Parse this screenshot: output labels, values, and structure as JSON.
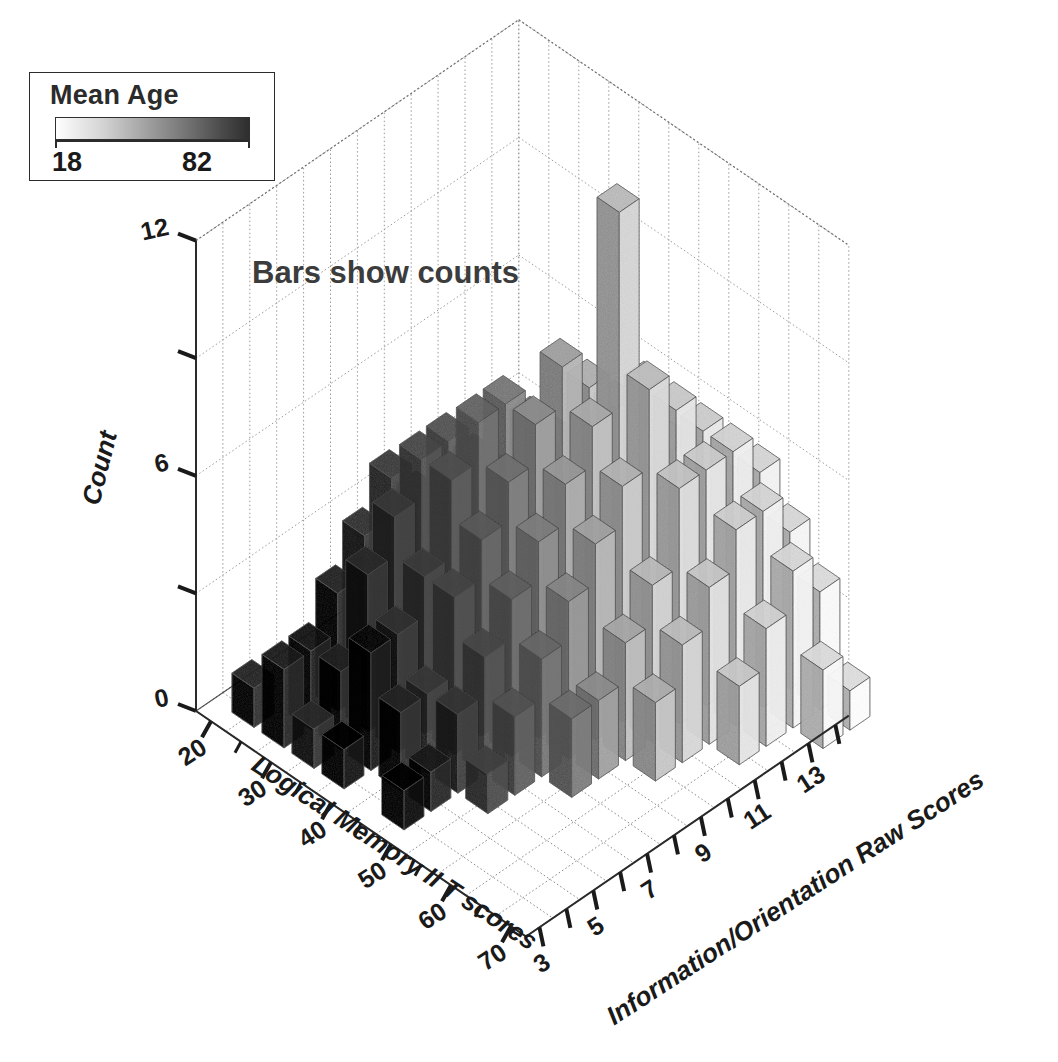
{
  "figure": {
    "annotation": "Bars show counts",
    "background": "#ffffff"
  },
  "legend": {
    "title": "Mean Age",
    "min_label": "18",
    "max_label": "82",
    "min_color": "#ffffff",
    "max_color": "#2e2e2e",
    "ramp_name": "grayscale-ramp"
  },
  "chart_data": {
    "type": "bar",
    "subtype": "3d-bar-histogram",
    "title": "",
    "annotation": "Bars show counts",
    "xlabel": "Logical Memory II T scores",
    "ylabel": "Information/Orientation Raw Scores",
    "zlabel": "Count",
    "xlim": [
      17.5,
      72.5
    ],
    "ylim": [
      2.5,
      14.5
    ],
    "zlim": [
      0,
      12
    ],
    "x_ticks": [
      20,
      30,
      40,
      50,
      60,
      70
    ],
    "x_ticklabels": [
      "20",
      "30",
      "40",
      "50",
      "60",
      "70"
    ],
    "x_minor_ticks": [
      25,
      35,
      45,
      55,
      65
    ],
    "y_ticks": [
      3,
      4,
      5,
      6,
      7,
      8,
      9,
      10,
      11,
      12,
      13,
      14
    ],
    "y_ticklabels": [
      "3",
      "",
      "5",
      "",
      "7",
      "",
      "9",
      "",
      "11",
      "",
      "13",
      ""
    ],
    "z_ticks": [
      0,
      3,
      6,
      9,
      12
    ],
    "z_ticklabels": [
      "0",
      "",
      "6",
      "",
      "12"
    ],
    "grid": true,
    "legend_position": "top-left",
    "color_scale": {
      "name": "Mean Age",
      "domain": [
        18,
        82
      ],
      "range": [
        "#ffffff",
        "#2e2e2e"
      ],
      "type": "grayscale-sequential"
    },
    "bar_cell_size": {
      "x": 5,
      "y": 1
    },
    "value_key": "count",
    "color_key": "mean_age",
    "bars": [
      {
        "x": 20,
        "y": 3,
        "count": 1,
        "mean_age": 74
      },
      {
        "x": 25,
        "y": 3,
        "count": 2,
        "mean_age": 76
      },
      {
        "x": 30,
        "y": 3,
        "count": 1,
        "mean_age": 73
      },
      {
        "x": 35,
        "y": 3,
        "count": 1,
        "mean_age": 79
      },
      {
        "x": 45,
        "y": 3,
        "count": 1,
        "mean_age": 80
      },
      {
        "x": 25,
        "y": 4,
        "count": 2,
        "mean_age": 77
      },
      {
        "x": 30,
        "y": 4,
        "count": 2,
        "mean_age": 75
      },
      {
        "x": 35,
        "y": 4,
        "count": 3,
        "mean_age": 78
      },
      {
        "x": 40,
        "y": 4,
        "count": 2,
        "mean_age": 74
      },
      {
        "x": 45,
        "y": 4,
        "count": 1,
        "mean_age": 76
      },
      {
        "x": 25,
        "y": 5,
        "count": 3,
        "mean_age": 75
      },
      {
        "x": 30,
        "y": 5,
        "count": 4,
        "mean_age": 73
      },
      {
        "x": 35,
        "y": 5,
        "count": 3,
        "mean_age": 72
      },
      {
        "x": 40,
        "y": 5,
        "count": 2,
        "mean_age": 70
      },
      {
        "x": 45,
        "y": 5,
        "count": 2,
        "mean_age": 71
      },
      {
        "x": 50,
        "y": 5,
        "count": 1,
        "mean_age": 68
      },
      {
        "x": 25,
        "y": 6,
        "count": 4,
        "mean_age": 72
      },
      {
        "x": 30,
        "y": 6,
        "count": 5,
        "mean_age": 70
      },
      {
        "x": 35,
        "y": 6,
        "count": 4,
        "mean_age": 69
      },
      {
        "x": 40,
        "y": 6,
        "count": 4,
        "mean_age": 67
      },
      {
        "x": 45,
        "y": 6,
        "count": 3,
        "mean_age": 66
      },
      {
        "x": 50,
        "y": 6,
        "count": 2,
        "mean_age": 63
      },
      {
        "x": 25,
        "y": 7,
        "count": 5,
        "mean_age": 69
      },
      {
        "x": 30,
        "y": 7,
        "count": 6,
        "mean_age": 66
      },
      {
        "x": 35,
        "y": 7,
        "count": 6,
        "mean_age": 64
      },
      {
        "x": 40,
        "y": 7,
        "count": 5,
        "mean_age": 61
      },
      {
        "x": 45,
        "y": 7,
        "count": 4,
        "mean_age": 59
      },
      {
        "x": 50,
        "y": 7,
        "count": 3,
        "mean_age": 57
      },
      {
        "x": 55,
        "y": 7,
        "count": 2,
        "mean_age": 55
      },
      {
        "x": 25,
        "y": 8,
        "count": 4,
        "mean_age": 67
      },
      {
        "x": 30,
        "y": 8,
        "count": 6,
        "mean_age": 63
      },
      {
        "x": 35,
        "y": 8,
        "count": 7,
        "mean_age": 58
      },
      {
        "x": 40,
        "y": 8,
        "count": 6,
        "mean_age": 54
      },
      {
        "x": 45,
        "y": 8,
        "count": 5,
        "mean_age": 50
      },
      {
        "x": 50,
        "y": 8,
        "count": 4,
        "mean_age": 47
      },
      {
        "x": 55,
        "y": 8,
        "count": 2,
        "mean_age": 45
      },
      {
        "x": 30,
        "y": 9,
        "count": 5,
        "mean_age": 58
      },
      {
        "x": 35,
        "y": 9,
        "count": 7,
        "mean_age": 52
      },
      {
        "x": 40,
        "y": 9,
        "count": 7,
        "mean_age": 45
      },
      {
        "x": 45,
        "y": 9,
        "count": 6,
        "mean_age": 41
      },
      {
        "x": 50,
        "y": 9,
        "count": 5,
        "mean_age": 38
      },
      {
        "x": 55,
        "y": 9,
        "count": 3,
        "mean_age": 36
      },
      {
        "x": 60,
        "y": 9,
        "count": 2,
        "mean_age": 34
      },
      {
        "x": 30,
        "y": 10,
        "count": 4,
        "mean_age": 54
      },
      {
        "x": 35,
        "y": 10,
        "count": 6,
        "mean_age": 46
      },
      {
        "x": 40,
        "y": 10,
        "count": 8,
        "mean_age": 39
      },
      {
        "x": 45,
        "y": 10,
        "count": 7,
        "mean_age": 35
      },
      {
        "x": 50,
        "y": 10,
        "count": 6,
        "mean_age": 32
      },
      {
        "x": 55,
        "y": 10,
        "count": 4,
        "mean_age": 30
      },
      {
        "x": 60,
        "y": 10,
        "count": 3,
        "mean_age": 29
      },
      {
        "x": 35,
        "y": 11,
        "count": 5,
        "mean_age": 42
      },
      {
        "x": 40,
        "y": 11,
        "count": 7,
        "mean_age": 34
      },
      {
        "x": 45,
        "y": 11,
        "count": 12,
        "mean_age": 30
      },
      {
        "x": 50,
        "y": 11,
        "count": 8,
        "mean_age": 28
      },
      {
        "x": 55,
        "y": 11,
        "count": 6,
        "mean_age": 27
      },
      {
        "x": 60,
        "y": 11,
        "count": 4,
        "mean_age": 26
      },
      {
        "x": 65,
        "y": 11,
        "count": 2,
        "mean_age": 25
      },
      {
        "x": 35,
        "y": 12,
        "count": 4,
        "mean_age": 38
      },
      {
        "x": 40,
        "y": 12,
        "count": 6,
        "mean_age": 31
      },
      {
        "x": 45,
        "y": 12,
        "count": 7,
        "mean_age": 27
      },
      {
        "x": 50,
        "y": 12,
        "count": 7,
        "mean_age": 25
      },
      {
        "x": 55,
        "y": 12,
        "count": 6,
        "mean_age": 24
      },
      {
        "x": 60,
        "y": 12,
        "count": 5,
        "mean_age": 23
      },
      {
        "x": 65,
        "y": 12,
        "count": 3,
        "mean_age": 22
      },
      {
        "x": 40,
        "y": 13,
        "count": 4,
        "mean_age": 29
      },
      {
        "x": 45,
        "y": 13,
        "count": 5,
        "mean_age": 26
      },
      {
        "x": 50,
        "y": 13,
        "count": 6,
        "mean_age": 24
      },
      {
        "x": 55,
        "y": 13,
        "count": 6,
        "mean_age": 22
      },
      {
        "x": 60,
        "y": 13,
        "count": 5,
        "mean_age": 21
      },
      {
        "x": 65,
        "y": 13,
        "count": 4,
        "mean_age": 20
      },
      {
        "x": 70,
        "y": 13,
        "count": 2,
        "mean_age": 19
      },
      {
        "x": 45,
        "y": 14,
        "count": 3,
        "mean_age": 25
      },
      {
        "x": 50,
        "y": 14,
        "count": 4,
        "mean_age": 23
      },
      {
        "x": 55,
        "y": 14,
        "count": 5,
        "mean_age": 21
      },
      {
        "x": 60,
        "y": 14,
        "count": 4,
        "mean_age": 20
      },
      {
        "x": 65,
        "y": 14,
        "count": 3,
        "mean_age": 19
      },
      {
        "x": 70,
        "y": 14,
        "count": 1,
        "mean_age": 18
      }
    ]
  }
}
